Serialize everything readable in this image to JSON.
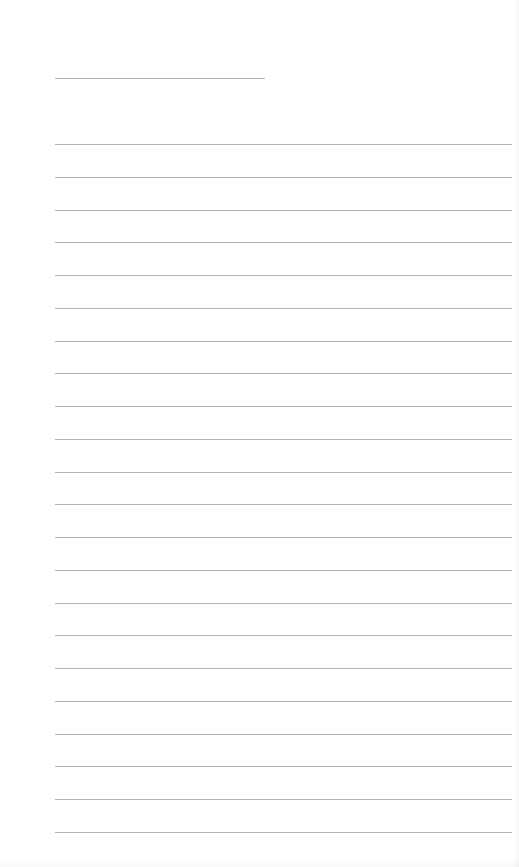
{
  "page": {
    "type": "lined-paper",
    "background_color": "#ffffff",
    "line_color": "#b4b4b4",
    "title_line": {
      "x": 55,
      "y": 78,
      "width": 210
    },
    "ruled_lines": {
      "count": 22,
      "x": 55,
      "width": 457,
      "first_y": 144,
      "spacing": 32.76
    }
  }
}
